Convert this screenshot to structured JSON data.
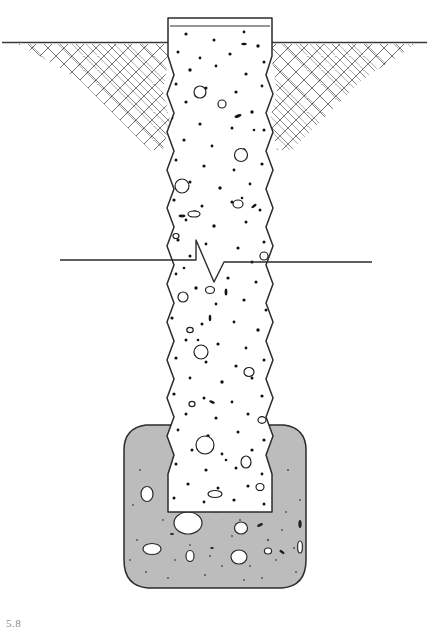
{
  "figure": {
    "type": "geotechnical-cross-section",
    "width": 429,
    "height": 627,
    "background": "#ffffff",
    "caption": "5.8"
  },
  "colors": {
    "outline": "#2b2b2b",
    "ground_line": "#3a3a3a",
    "hatch_stroke": "#6e6e6e",
    "concrete_fill": "#ffffff",
    "aggregate": "#1a1a1a",
    "bulb_fill": "#bcbcbc",
    "bulb_stroke": "#2b2b2b",
    "bulb_speckle": "#5a5a5a",
    "break_line": "#2b2b2b",
    "water_line": "#4a4a4a",
    "caption_text": "#8b8b8b"
  },
  "elements": {
    "ground_surface": {
      "label": "ground-surface-line",
      "y": 42,
      "x_start": 0,
      "x_end": 429
    },
    "excavation_wedge": {
      "label": "hatched-soil-wedge",
      "pattern": "double-diagonal-crosshatch",
      "left_top_x": 18,
      "right_top_x": 415,
      "max_depth_y": 152,
      "hatch_spacing": 6
    },
    "pile_head": {
      "label": "pile-head-cap",
      "top_y": 18,
      "left_x": 168,
      "right_x": 272
    },
    "pile_shaft": {
      "label": "concrete-shaft",
      "edge_style": "wavy-scalloped",
      "left_x": 168,
      "right_x": 272,
      "top_y": 18,
      "bottom_y": 512,
      "wave_amplitude": 6,
      "wave_period": 38
    },
    "break_line": {
      "label": "shaft-break-symbol",
      "y": 260,
      "x_left": 60,
      "x_right": 372,
      "zig_x": 214
    },
    "grouted_bulb": {
      "label": "enlarged-grouted-base",
      "left_x": 124,
      "right_x": 306,
      "top_y": 424,
      "bottom_y": 588,
      "fill": "#bcbcbc"
    }
  },
  "legend_notes": {
    "concrete": "aggregate-dotted concrete fill",
    "soil": "crosshatched in-situ soil",
    "base": "shaded enlarged base / grout bulb"
  }
}
